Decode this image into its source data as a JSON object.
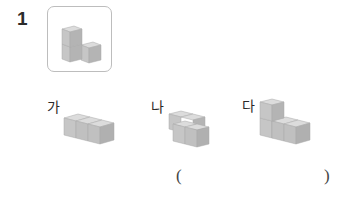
{
  "question": {
    "number": "1",
    "reference_figure": "L-shaped stack of 3 cubes (2 tall on left, 1 on right)"
  },
  "options": [
    {
      "label": "가",
      "description": "3 cubes in a straight row"
    },
    {
      "label": "나",
      "description": "4 cubes in a 2x2 flat block"
    },
    {
      "label": "다",
      "description": "4 cubes: 2 tall on left, 2 in a row on the right"
    }
  ],
  "answer_blank": {
    "open": "(",
    "close": ")",
    "value": ""
  },
  "colors": {
    "cube_top": "#dcdcdc",
    "cube_left": "#c4c4c4",
    "cube_right": "#b2b2b2",
    "cube_edge": "#9e9e9e",
    "box_border": "#bdbdbd"
  }
}
